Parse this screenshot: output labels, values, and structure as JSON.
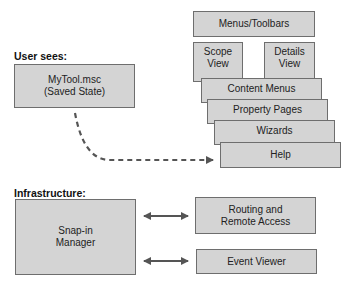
{
  "user_section": {
    "label": "User sees:",
    "console_file": {
      "line1": "MyTool.msc",
      "line2": "(Saved State)"
    }
  },
  "ui_stack": {
    "menus_toolbars": "Menus/Toolbars",
    "scope_view": {
      "line1": "Scope",
      "line2": "View"
    },
    "details_view": {
      "line1": "Details",
      "line2": "View"
    },
    "content_menus": "Content Menus",
    "property_pages": "Property Pages",
    "wizards": "Wizards",
    "help": "Help"
  },
  "infrastructure": {
    "label": "Infrastructure:",
    "snapin_manager": {
      "line1": "Snap-in",
      "line2": "Manager"
    },
    "routing": {
      "line1": "Routing and",
      "line2": "Remote Access"
    },
    "event_viewer": "Event Viewer"
  },
  "colors": {
    "box_fill": "#d4d4d4",
    "box_border": "#6e6e6e",
    "arrow": "#555555"
  }
}
